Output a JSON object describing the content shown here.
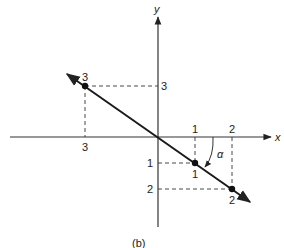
{
  "figure": {
    "caption": "(b)",
    "axes": {
      "x_label": "x",
      "y_label": "y"
    },
    "angle_label": "α",
    "colors": {
      "ink": "#222222",
      "background": "#ffffff"
    },
    "tick_labels": {
      "x_neg_3": "3",
      "y_pos_3": "3",
      "x_pos_1": "1",
      "x_pos_2": "2",
      "y_neg_1": "1",
      "y_neg_2": "2"
    },
    "points": [
      {
        "label": "3",
        "x": -3,
        "y": 3
      },
      {
        "label": "1",
        "x": 1,
        "y": -1
      },
      {
        "label": "2",
        "x": 2,
        "y": -2
      }
    ],
    "line": {
      "description": "y = -x",
      "direction": "double-arrow"
    }
  }
}
